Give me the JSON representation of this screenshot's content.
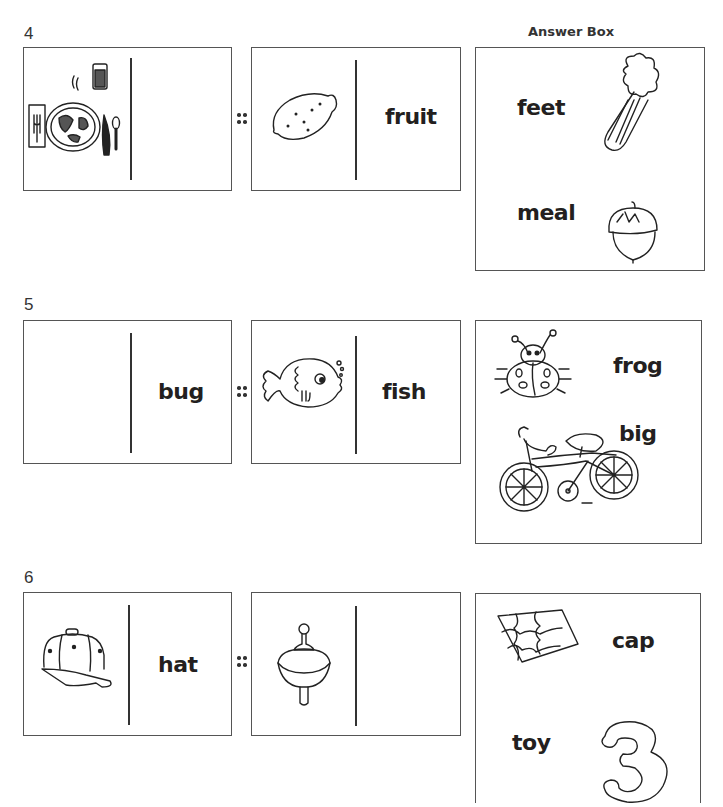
{
  "header": {
    "answer_box_title": "Answer Box"
  },
  "problems": [
    {
      "number": "4",
      "pair_a": {
        "picture": "meal-place-setting",
        "word": ""
      },
      "separator": "::",
      "pair_b": {
        "picture": "lemon",
        "word": "fruit"
      },
      "answer_box": [
        {
          "word": "feet",
          "picture": "celery"
        },
        {
          "word": "meal",
          "picture": "acorn"
        }
      ]
    },
    {
      "number": "5",
      "pair_a": {
        "picture": "",
        "word": "bug"
      },
      "separator": "::",
      "pair_b": {
        "picture": "fish",
        "word": "fish"
      },
      "answer_box": [
        {
          "word": "frog",
          "picture": "ladybug"
        },
        {
          "word": "big",
          "picture": "bicycle"
        }
      ]
    },
    {
      "number": "6",
      "pair_a": {
        "picture": "baseball-cap",
        "word": "hat"
      },
      "separator": "::",
      "pair_b": {
        "picture": "spinning-top",
        "word": ""
      },
      "answer_box": [
        {
          "word": "cap",
          "picture": "puzzle"
        },
        {
          "word": "toy",
          "picture": "number-three"
        }
      ]
    }
  ]
}
